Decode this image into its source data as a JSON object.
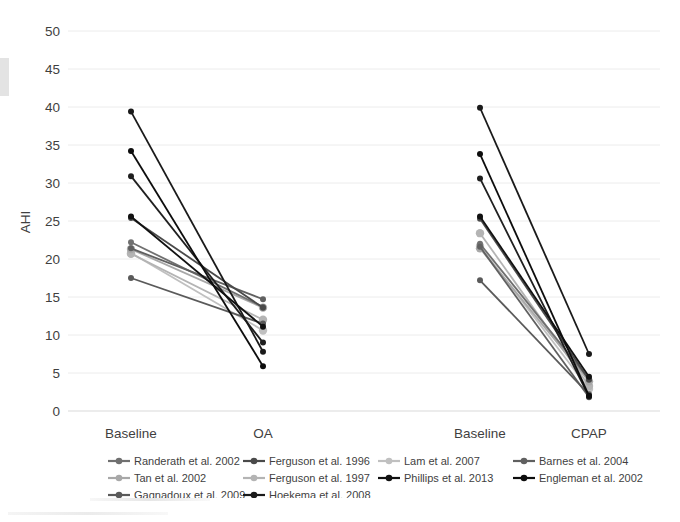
{
  "chart_data": {
    "type": "line",
    "title": "",
    "subtitle": "",
    "xlabel": "",
    "ylabel": "AHI",
    "ylim": [
      0,
      50
    ],
    "ytick_labels": [
      "0",
      "5",
      "10",
      "15",
      "20",
      "25",
      "30",
      "35",
      "40",
      "45",
      "50"
    ],
    "ytick_values": [
      0,
      5,
      10,
      15,
      20,
      25,
      30,
      35,
      40,
      45,
      50
    ],
    "grid": true,
    "legend_position": "bottom",
    "panels": [
      {
        "name": "oral-appliance-panel",
        "categories": [
          "Baseline",
          "OA"
        ]
      },
      {
        "name": "cpap-panel",
        "categories": [
          "Baseline",
          "CPAP"
        ]
      }
    ],
    "xtick_labels": [
      "Baseline",
      "OA",
      "Baseline",
      "CPAP"
    ],
    "series": [
      {
        "name": "Randerath et al. 2002",
        "color": "#707070",
        "oa": [
          22.2,
          13.7
        ],
        "cpap": [
          22.0,
          4.2
        ]
      },
      {
        "name": "Tan et al. 2002",
        "color": "#a8a8a8",
        "oa": [
          21.3,
          13.6
        ],
        "cpap": [
          21.4,
          3.9
        ]
      },
      {
        "name": "Gagnadoux et al. 2009",
        "color": "#5a5a5a",
        "oa": [
          17.5,
          11.5
        ],
        "cpap": [
          17.2,
          2.2
        ]
      },
      {
        "name": "Ferguson et al. 1996",
        "color": "#4a4a4a",
        "oa": [
          25.4,
          13.6
        ],
        "cpap": [
          25.3,
          4.1
        ]
      },
      {
        "name": "Ferguson et al. 1997",
        "color": "#b4b4b4",
        "oa": [
          20.7,
          12.0
        ],
        "cpap": [
          23.4,
          3.3
        ]
      },
      {
        "name": "Hoekema et al. 2008",
        "color": "#1a1a1a",
        "oa": [
          39.4,
          7.8
        ],
        "cpap": [
          39.9,
          7.5
        ]
      },
      {
        "name": "Lam et al. 2007",
        "color": "#c0c0c0",
        "oa": [
          20.8,
          10.6
        ],
        "cpap": [
          21.7,
          2.9
        ]
      },
      {
        "name": "Phillips et al. 2013",
        "color": "#111111",
        "oa": [
          25.6,
          11.1
        ],
        "cpap": [
          25.6,
          4.5
        ]
      },
      {
        "name": "Barnes et al. 2004",
        "color": "#606060",
        "oa": [
          21.4,
          14.7
        ],
        "cpap": [
          21.6,
          1.8
        ]
      },
      {
        "name": "Engleman et al. 2002",
        "color": "#0d0d0d",
        "oa": [
          34.2,
          5.9
        ],
        "cpap": [
          33.8,
          2.0
        ]
      }
    ],
    "extra_points": [
      {
        "name": "unlabeled-dark-oa",
        "color": "#1f1f1f",
        "oa": [
          30.9,
          9.0
        ],
        "cpap": [
          30.6,
          1.9
        ]
      }
    ],
    "legend": [
      {
        "label": "Randerath et al. 2002",
        "color": "#707070"
      },
      {
        "label": "Ferguson et al. 1996",
        "color": "#4a4a4a"
      },
      {
        "label": "Lam et al. 2007",
        "color": "#c0c0c0"
      },
      {
        "label": "Barnes et al. 2004",
        "color": "#606060"
      },
      {
        "label": "Tan et al. 2002",
        "color": "#a8a8a8"
      },
      {
        "label": "Ferguson et al. 1997",
        "color": "#b4b4b4"
      },
      {
        "label": "Phillips et al. 2013",
        "color": "#111111"
      },
      {
        "label": "Engleman et al. 2002",
        "color": "#0d0d0d"
      },
      {
        "label": "Gagnadoux et al. 2009",
        "color": "#5a5a5a"
      },
      {
        "label": "Hoekema et al. 2008",
        "color": "#1a1a1a"
      }
    ]
  },
  "colors": {
    "background": "#ffffff",
    "gridline": "#ececec",
    "text": "#3f3f3f"
  }
}
